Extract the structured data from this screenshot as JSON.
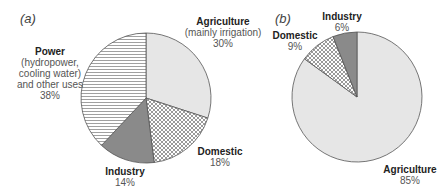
{
  "chart_data": [
    {
      "type": "pie",
      "panel": "(a)",
      "title": "",
      "start_angle": "12 o'clock, clockwise",
      "categories": [
        "Agriculture",
        "Domestic",
        "Industry",
        "Power"
      ],
      "values": [
        30,
        18,
        14,
        38
      ],
      "unit": "%",
      "labels": [
        {
          "name": "Agriculture",
          "sub": "(mainly irrigation)",
          "value": "30%"
        },
        {
          "name": "Domestic",
          "sub": "",
          "value": "18%"
        },
        {
          "name": "Industry",
          "sub": "",
          "value": "14%"
        },
        {
          "name": "Power",
          "sub": "(hydropower, cooling water) and other uses",
          "value": "38%"
        }
      ],
      "fills": {
        "Agriculture": "light-gray",
        "Domestic": "crosshatch",
        "Industry": "dark-gray",
        "Power": "horizontal-lines"
      }
    },
    {
      "type": "pie",
      "panel": "(b)",
      "title": "",
      "start_angle": "12 o'clock, clockwise",
      "categories": [
        "Agriculture",
        "Domestic",
        "Industry"
      ],
      "values": [
        85,
        9,
        6
      ],
      "unit": "%",
      "labels": [
        {
          "name": "Agriculture",
          "value": "85%"
        },
        {
          "name": "Domestic",
          "value": "9%"
        },
        {
          "name": "Industry",
          "value": "6%"
        }
      ],
      "fills": {
        "Agriculture": "light-gray",
        "Domestic": "crosshatch",
        "Industry": "dark-gray"
      }
    }
  ],
  "panels": {
    "a": {
      "label": "(a)",
      "agriculture": {
        "name": "Agriculture",
        "sub": "(mainly irrigation)",
        "value": "30%"
      },
      "domestic": {
        "name": "Domestic",
        "value": "18%"
      },
      "industry": {
        "name": "Industry",
        "value": "14%"
      },
      "power": {
        "name": "Power",
        "sub1": "(hydropower,",
        "sub2": "cooling water)",
        "sub3": "and other uses",
        "value": "38%"
      }
    },
    "b": {
      "label": "(b)",
      "agriculture": {
        "name": "Agriculture",
        "value": "85%"
      },
      "domestic": {
        "name": "Domestic",
        "value": "9%"
      },
      "industry": {
        "name": "Industry",
        "value": "6%"
      }
    }
  },
  "colors": {
    "light_gray": "#e6e6e6",
    "dark_gray": "#8a8a8a",
    "outline": "#555555",
    "hatch": "#666666"
  }
}
